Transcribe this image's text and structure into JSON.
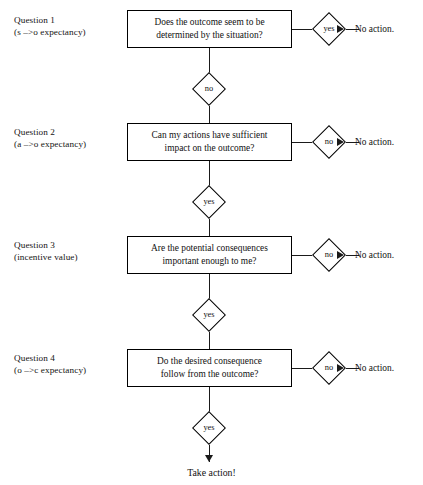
{
  "diagram": {
    "terminal": {
      "take_action_label": "Take action!"
    },
    "rows": [
      {
        "question_title": "Question 1",
        "question_subtitle": "(s –>o expectancy)",
        "box_line1": "Does the outcome seem to be",
        "box_line2": "determined by the situation?",
        "branch_label": "yes",
        "branch_outcome": "No action.",
        "next_label": "no"
      },
      {
        "question_title": "Question 2",
        "question_subtitle": "(a –>o expectancy)",
        "box_line1": "Can my actions have sufficient",
        "box_line2": "impact on the outcome?",
        "branch_label": "no",
        "branch_outcome": "No action.",
        "next_label": "yes"
      },
      {
        "question_title": "Question 3",
        "question_subtitle": "(incentive value)",
        "box_line1": "Are the potential consequences",
        "box_line2": "important enough to me?",
        "branch_label": "no",
        "branch_outcome": "No action.",
        "next_label": "yes"
      },
      {
        "question_title": "Question 4",
        "question_subtitle": "(o –>c expectancy)",
        "box_line1": "Do the desired consequence",
        "box_line2": "follow from the outcome?",
        "branch_label": "no",
        "branch_outcome": "No action.",
        "next_label": "yes"
      }
    ],
    "colors": {
      "stroke": "#1a1a1a",
      "text": "#121212",
      "background": "#ffffff"
    }
  }
}
